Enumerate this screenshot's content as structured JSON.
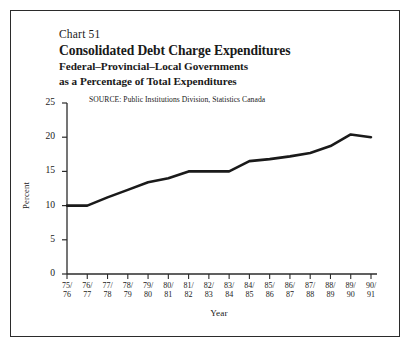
{
  "figure": {
    "chart_number": "Chart 51",
    "title": "Consolidated Debt Charge Expenditures",
    "subtitle_line1": "Federal–Provincial–Local Governments",
    "subtitle_line2": "as a Percentage of Total Expenditures",
    "source": "SOURCE:  Public Institutions Division, Statistics Canada",
    "line_color": "#1a1a1a",
    "frame_color": "#2b2b2b"
  },
  "chart_data": {
    "type": "line",
    "title": "Consolidated Debt Charge Expenditures",
    "subtitle": "Federal–Provincial–Local Governments as a Percentage of Total Expenditures",
    "xlabel": "Year",
    "ylabel": "Percent",
    "ylim": [
      0,
      25
    ],
    "yticks": [
      0,
      5,
      10,
      15,
      20,
      25
    ],
    "ytick_labels": [
      "0",
      "5",
      "10",
      "15",
      "20",
      "25"
    ],
    "grid": false,
    "legend": "none",
    "categories": [
      "75/76",
      "76/77",
      "77/78",
      "78/79",
      "79/80",
      "80/81",
      "81/82",
      "82/83",
      "83/84",
      "84/85",
      "85/86",
      "86/87",
      "87/88",
      "88/89",
      "89/90",
      "90/91"
    ],
    "xtick_top": [
      "75/",
      "76/",
      "77/",
      "78/",
      "79/",
      "80/",
      "81/",
      "82/",
      "83/",
      "84/",
      "85/",
      "86/",
      "87/",
      "88/",
      "89/",
      "90/"
    ],
    "xtick_bottom": [
      "76",
      "77",
      "78",
      "79",
      "80",
      "81",
      "82",
      "83",
      "84",
      "85",
      "86",
      "87",
      "88",
      "89",
      "90",
      "91"
    ],
    "values": [
      10.0,
      10.0,
      11.2,
      12.3,
      13.4,
      14.0,
      15.0,
      15.0,
      15.0,
      16.5,
      16.8,
      17.2,
      17.7,
      18.7,
      20.4,
      20.0
    ],
    "series": [
      {
        "name": "Debt charge expenditures as % of total expenditures",
        "values": [
          10.0,
          10.0,
          11.2,
          12.3,
          13.4,
          14.0,
          15.0,
          15.0,
          15.0,
          16.5,
          16.8,
          17.2,
          17.7,
          18.7,
          20.4,
          20.0
        ]
      }
    ]
  }
}
